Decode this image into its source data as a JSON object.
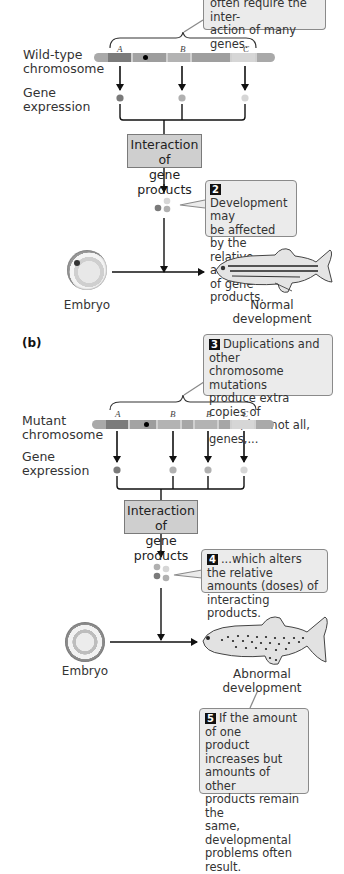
{
  "panel_a": {
    "callout_1_text": "often require the inter-action of many genes.",
    "callout_1_lines": [
      "often require the inter-",
      "action of many genes."
    ],
    "chromosome_label_lines": [
      "Wild-type",
      "chromosome"
    ],
    "gene_expression_lines": [
      "Gene",
      "expression"
    ],
    "genes": [
      "A",
      "B",
      "C"
    ],
    "interaction_box_lines": [
      "Interaction of",
      "gene products"
    ],
    "callout_2_number": "2",
    "callout_2_lines": [
      "Development may",
      "be affected by the",
      "relative amounts",
      "of gene products."
    ],
    "embryo_label": "Embryo",
    "outcome_lines": [
      "Normal",
      "development"
    ]
  },
  "panel_b": {
    "panel_label": "(b)",
    "callout_3_number": "3",
    "callout_3_lines": [
      "Duplications and other",
      "chromosome mutations",
      "produce extra copies of",
      "some, but not all, genes,..."
    ],
    "chromosome_label_lines": [
      "Mutant",
      "chromosome"
    ],
    "gene_expression_lines": [
      "Gene",
      "expression"
    ],
    "genes": [
      "A",
      "B",
      "B",
      "C"
    ],
    "interaction_box_lines": [
      "Interaction of",
      "gene products"
    ],
    "callout_4_number": "4",
    "callout_4_lines": [
      "...which alters the relative",
      "amounts (doses) of",
      "interacting products."
    ],
    "embryo_label": "Embryo",
    "outcome_lines": [
      "Abnormal",
      "development"
    ],
    "callout_5_number": "5",
    "callout_5_lines": [
      "If the amount of one",
      "product increases but",
      "amounts of other",
      "products remain the",
      "same, developmental",
      "problems often result."
    ]
  },
  "colors": {
    "callout_bg": "#ebebeb",
    "interaction_box_bg": "#cfcfcf",
    "gene_A": "#7a7a7a",
    "gene_B": "#b0b0b0",
    "gene_C": "#d6d6d6",
    "chromosome_base": "#a8a8a8"
  }
}
